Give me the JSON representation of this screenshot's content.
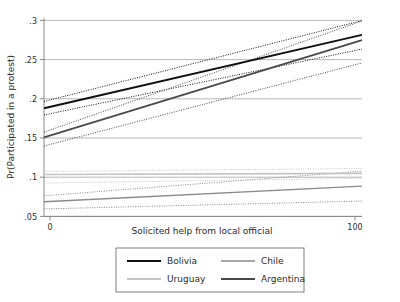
{
  "chart_data": {
    "type": "line",
    "title": "",
    "xlabel": "Solicited help from local official",
    "ylabel": "Pr(Participated in a protest)",
    "xlim": [
      0,
      100
    ],
    "ylim": [
      0.04,
      0.305
    ],
    "x": [
      0,
      100
    ],
    "xticks": [
      0,
      100
    ],
    "xtick_labels": [
      "0",
      "100"
    ],
    "yticks": [
      0.05,
      0.1,
      0.15,
      0.2,
      0.25,
      0.3
    ],
    "ytick_labels": [
      ".05",
      ".1",
      ".15",
      ".2",
      ".25",
      ".3"
    ],
    "grid": "horizontal",
    "legend_position": "below-axis",
    "series": [
      {
        "name": "Bolivia",
        "color": "#101010",
        "width": 2.0,
        "values": [
          0.1845,
          0.2825
        ],
        "ci_upper": [
          0.1935,
          0.3015
        ],
        "ci_lower": [
          0.1755,
          0.2635
        ]
      },
      {
        "name": "Chile",
        "color": "#8a8a8a",
        "width": 1.4,
        "values": [
          0.0595,
          0.0805
        ],
        "ci_upper": [
          0.0675,
          0.1005
        ],
        "ci_lower": [
          0.05,
          0.0605
        ]
      },
      {
        "name": "Uruguay",
        "color": "#c4c4c4",
        "width": 1.6,
        "values": [
          0.096,
          0.0975
        ],
        "ci_upper": [
          0.1,
          0.104
        ],
        "ci_lower": [
          0.0845,
          0.091
        ]
      },
      {
        "name": "Argentina",
        "color": "#4a4a4a",
        "width": 1.8,
        "values": [
          0.1455,
          0.2755
        ],
        "ci_upper": [
          0.1525,
          0.301
        ],
        "ci_lower": [
          0.134,
          0.245
        ]
      }
    ],
    "ci_style": "dotted",
    "ci_note": "Dotted confidence interval bands accompany each fitted line"
  },
  "legend": {
    "entries": [
      {
        "label": "Bolivia",
        "color": "#101010"
      },
      {
        "label": "Chile",
        "color": "#8a8a8a"
      },
      {
        "label": "Uruguay",
        "color": "#c4c4c4"
      },
      {
        "label": "Argentina",
        "color": "#4a4a4a"
      }
    ]
  },
  "colors": {
    "background": "#ffffff",
    "axis": "#7d7d7d",
    "grid": "#9a9a9a",
    "text": "#2b2b2b",
    "legend_border": "#6f6f6f"
  }
}
